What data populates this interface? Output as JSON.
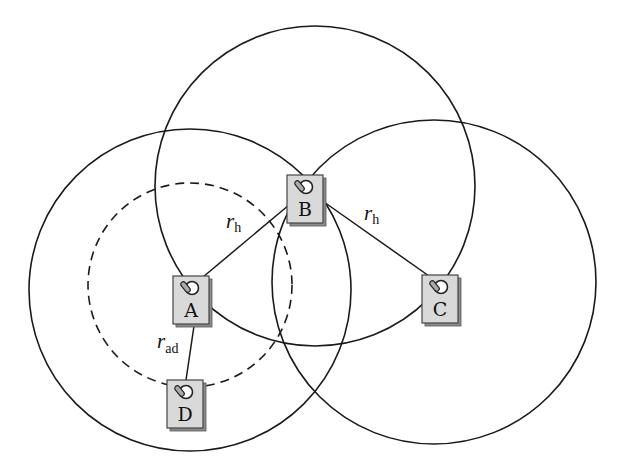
{
  "diagram": {
    "type": "wireless-network-range-diagram",
    "ranges": [
      {
        "id": "range-A",
        "center_node": "A",
        "style": "solid"
      },
      {
        "id": "range-B",
        "center_node": "B",
        "style": "solid"
      },
      {
        "id": "range-C",
        "center_node": "C",
        "style": "solid"
      },
      {
        "id": "range-A-adhoc",
        "center_node": "A",
        "style": "dashed"
      }
    ],
    "nodes": [
      {
        "id": "A",
        "label": "A"
      },
      {
        "id": "B",
        "label": "B"
      },
      {
        "id": "C",
        "label": "C"
      },
      {
        "id": "D",
        "label": "D"
      }
    ],
    "edges": [
      {
        "from": "A",
        "to": "B",
        "label_main": "r",
        "label_sub": "h"
      },
      {
        "from": "B",
        "to": "C",
        "label_main": "r",
        "label_sub": "h"
      },
      {
        "from": "A",
        "to": "D",
        "label_main": "r",
        "label_sub": "ad"
      }
    ],
    "colors": {
      "stroke": "#1a1a1a",
      "node_fill": "#d9d9d9",
      "node_shadow": "#8c8c8c",
      "background": "#ffffff"
    }
  }
}
